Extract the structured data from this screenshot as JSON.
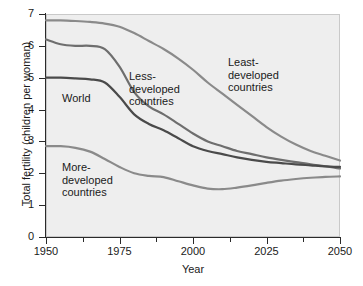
{
  "chart_data": {
    "type": "line",
    "title": "",
    "subtitle": "",
    "xlabel": "Year",
    "ylabel": "Total fertility (children per woman)",
    "xlim": [
      1950,
      2050
    ],
    "ylim": [
      0,
      7
    ],
    "xticks": [
      1950,
      1975,
      2000,
      2025,
      2050
    ],
    "xtick_labels": [
      "1950",
      "1975",
      "2000",
      "2025",
      "2050"
    ],
    "xminor_ticks": [
      1962.5,
      1987.5,
      2012.5,
      2037.5
    ],
    "yticks": [
      0,
      1,
      2,
      3,
      4,
      5,
      6,
      7
    ],
    "ytick_labels": [
      "0",
      "1",
      "2",
      "3",
      "4",
      "5",
      "6",
      "7"
    ],
    "grid": false,
    "legend_position": "inline-annotations",
    "x": [
      1950,
      1955,
      1960,
      1965,
      1970,
      1975,
      1980,
      1985,
      1990,
      1995,
      2000,
      2005,
      2010,
      2015,
      2020,
      2025,
      2030,
      2035,
      2040,
      2045,
      2050
    ],
    "series": [
      {
        "name": "Least-developed countries",
        "color": "#8a8a8a",
        "values": [
          6.8,
          6.8,
          6.78,
          6.75,
          6.7,
          6.6,
          6.4,
          6.15,
          5.9,
          5.6,
          5.25,
          4.85,
          4.5,
          4.15,
          3.8,
          3.45,
          3.15,
          2.9,
          2.7,
          2.55,
          2.4
        ]
      },
      {
        "name": "Less-developed countries",
        "color": "#6e6e6e",
        "values": [
          6.2,
          6.05,
          6.0,
          6.0,
          5.9,
          5.35,
          4.55,
          4.1,
          3.85,
          3.55,
          3.25,
          3.0,
          2.85,
          2.7,
          2.6,
          2.5,
          2.42,
          2.35,
          2.28,
          2.22,
          2.15
        ]
      },
      {
        "name": "World",
        "color": "#4a4a4a",
        "values": [
          5.0,
          5.0,
          4.98,
          4.95,
          4.85,
          4.4,
          3.85,
          3.55,
          3.35,
          3.1,
          2.85,
          2.7,
          2.6,
          2.5,
          2.42,
          2.36,
          2.32,
          2.28,
          2.25,
          2.22,
          2.2
        ]
      },
      {
        "name": "More-developed countries",
        "color": "#8a8a8a",
        "values": [
          2.85,
          2.85,
          2.8,
          2.68,
          2.45,
          2.2,
          2.0,
          1.92,
          1.88,
          1.75,
          1.62,
          1.52,
          1.5,
          1.55,
          1.62,
          1.7,
          1.77,
          1.82,
          1.86,
          1.89,
          1.9
        ]
      }
    ],
    "annotations": [
      {
        "text": "Least-\ndeveloped\ncountries",
        "series": "Least-developed countries"
      },
      {
        "text": "Less-\ndeveloped\ncountries",
        "series": "Less-developed countries"
      },
      {
        "text": "World",
        "series": "World"
      },
      {
        "text": "More-\ndeveloped\ncountries",
        "series": "More-developed countries"
      }
    ],
    "colors": {
      "plot_background": "#eeeeee",
      "page_background": "#ffffff",
      "axis": "#2a2a2a",
      "text": "#1a1a1a"
    }
  }
}
